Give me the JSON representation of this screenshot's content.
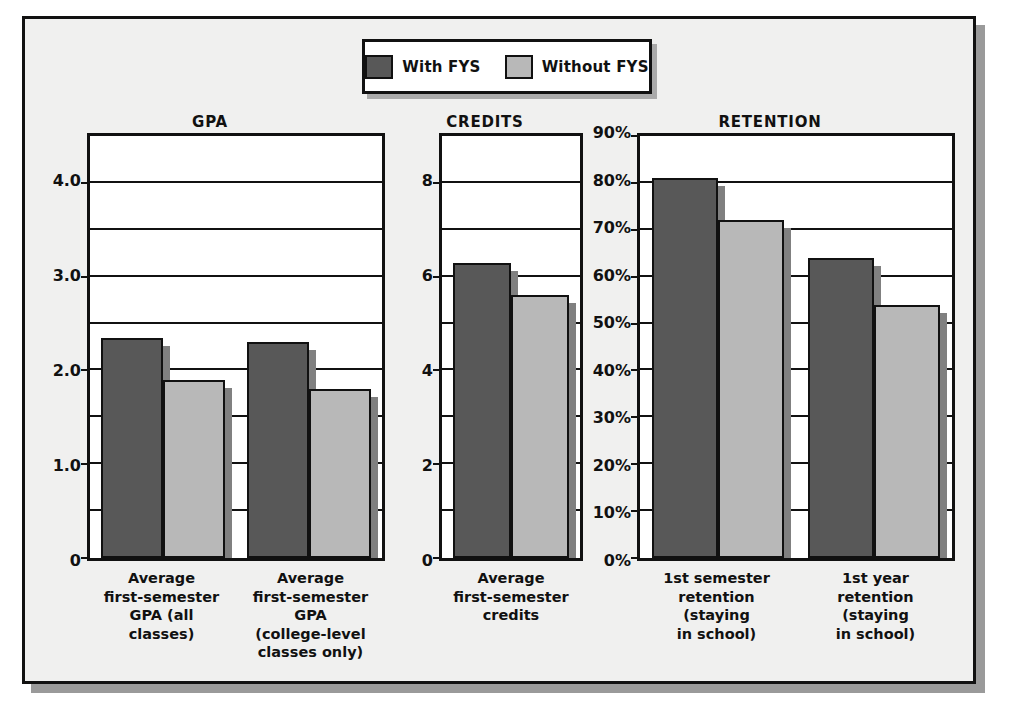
{
  "legend": {
    "entries": [
      {
        "label": "With FYS",
        "color": "#585858"
      },
      {
        "label": "Without FYS",
        "color": "#b8b8b8"
      }
    ]
  },
  "colors": {
    "with_fys": "#585858",
    "without_fys": "#b8b8b8",
    "frame_border": "#111111",
    "frame_background": "#f0f0ef",
    "plot_background": "#ffffff",
    "shadow": "#9a9a9a"
  },
  "chart_data": [
    {
      "type": "bar",
      "title": "GPA",
      "xlabel": "",
      "ylabel": "",
      "ylim": [
        0,
        4.5
      ],
      "grid": true,
      "grid_step": 0.5,
      "legend_position": "top-center",
      "tick_labels": [
        "0",
        "1.0",
        "2.0",
        "3.0",
        "4.0"
      ],
      "tick_values": [
        0,
        1.0,
        2.0,
        3.0,
        4.0
      ],
      "categories": [
        "Average first-semester GPA (all classes)",
        "Average first-semester GPA (college-level classes only)"
      ],
      "series": [
        {
          "name": "With FYS",
          "values": [
            2.35,
            2.3
          ]
        },
        {
          "name": "Without FYS",
          "values": [
            1.9,
            1.8
          ]
        }
      ]
    },
    {
      "type": "bar",
      "title": "CREDITS",
      "xlabel": "",
      "ylabel": "",
      "ylim": [
        0,
        9
      ],
      "grid": true,
      "grid_step": 1,
      "legend_position": "top-center",
      "tick_labels": [
        "0",
        "2",
        "4",
        "6",
        "8"
      ],
      "tick_values": [
        0,
        2,
        4,
        6,
        8
      ],
      "categories": [
        "Average first-semester credits"
      ],
      "series": [
        {
          "name": "With FYS",
          "values": [
            6.3
          ]
        },
        {
          "name": "Without FYS",
          "values": [
            5.6
          ]
        }
      ]
    },
    {
      "type": "bar",
      "title": "RETENTION",
      "xlabel": "",
      "ylabel": "",
      "ylim": [
        0,
        90
      ],
      "grid": true,
      "grid_step": 10,
      "legend_position": "top-center",
      "tick_labels": [
        "0%",
        "10%",
        "20%",
        "30%",
        "40%",
        "50%",
        "60%",
        "70%",
        "80%",
        "90%"
      ],
      "tick_values": [
        0,
        10,
        20,
        30,
        40,
        50,
        60,
        70,
        80,
        90
      ],
      "categories": [
        "1st semester retention (staying in school)",
        "1st year retention (staying in school)"
      ],
      "series": [
        {
          "name": "With FYS",
          "values": [
            81,
            64
          ]
        },
        {
          "name": "Without FYS",
          "values": [
            72,
            54
          ]
        }
      ]
    }
  ],
  "panels": {
    "gpa": {
      "title": "GPA",
      "categories": [
        "Average\nfirst-semester\nGPA (all\nclasses)",
        "Average\nfirst-semester\nGPA\n(college-level\nclasses only)"
      ]
    },
    "credits": {
      "title": "CREDITS",
      "categories": [
        "Average\nfirst-semester\ncredits"
      ]
    },
    "retention": {
      "title": "RETENTION",
      "categories": [
        "1st semester\nretention\n(staying\nin school)",
        "1st year\nretention\n(staying\nin school)"
      ]
    }
  }
}
